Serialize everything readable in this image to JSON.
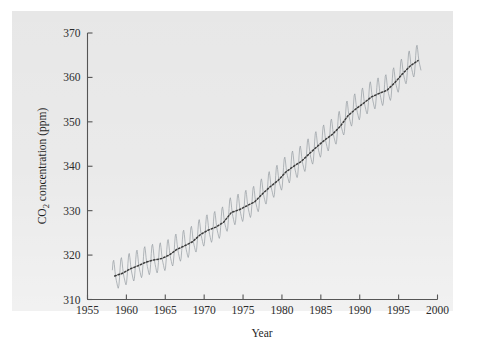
{
  "figure": {
    "background_color": "#ffffff",
    "panel_color": "#e6e6e6",
    "monthly_series_color": "#9aa0a6",
    "trend_series_color": "#3a3a3a"
  },
  "chart_data": {
    "type": "line",
    "title": "",
    "xlabel": "Year",
    "ylabel": "CO2 concentration (ppm)",
    "ylabel_parts": {
      "prefix": "CO",
      "subscript": "2",
      "suffix": " concentration (ppm)"
    },
    "xlim": [
      1955,
      2000
    ],
    "ylim": [
      310,
      370
    ],
    "xticks": [
      1955,
      1960,
      1965,
      1970,
      1975,
      1980,
      1985,
      1990,
      1995,
      2000
    ],
    "xtick_labels": [
      "1955",
      "1960",
      "1965",
      "1970",
      "1975",
      "1980",
      "1985",
      "1990",
      "1995",
      "2000"
    ],
    "yticks": [
      310,
      320,
      330,
      340,
      350,
      360,
      370
    ],
    "ytick_labels": [
      "310",
      "320",
      "330",
      "340",
      "350",
      "360",
      "370"
    ],
    "grid": false,
    "legend": null,
    "tick_direction": "in",
    "series": [
      {
        "name": "Monthly mean CO2",
        "color": "#9aa0a6",
        "style": "solid",
        "description": "Monthly Mauna Loa CO2 record with seasonal oscillation of about 6 ppm peak-to-trough",
        "x_start": 1958.2,
        "x_end": 1997.9,
        "seasonal_amplitude_ppm": 3.1,
        "seasonal_peak_month": 5,
        "seasonal_trough_month": 10
      },
      {
        "name": "Annual trend (smoothed)",
        "color": "#3a3a3a",
        "style": "dotted",
        "description": "Deseasonalized smooth trend through the monthly record",
        "x": [
          1958.5,
          1959.5,
          1960.5,
          1961.5,
          1962.5,
          1963.5,
          1964.5,
          1965.5,
          1966.5,
          1967.5,
          1968.5,
          1969.5,
          1970.5,
          1971.5,
          1972.5,
          1973.5,
          1974.5,
          1975.5,
          1976.5,
          1977.5,
          1978.5,
          1979.5,
          1980.5,
          1981.5,
          1982.5,
          1983.5,
          1984.5,
          1985.5,
          1986.5,
          1987.5,
          1988.5,
          1989.5,
          1990.5,
          1991.5,
          1992.5,
          1993.5,
          1994.5,
          1995.5,
          1996.5,
          1997.5
        ],
        "values": [
          315.3,
          315.9,
          316.9,
          317.6,
          318.4,
          318.9,
          319.2,
          320.0,
          321.3,
          322.1,
          323.0,
          324.6,
          325.6,
          326.3,
          327.4,
          329.6,
          330.2,
          331.1,
          332.0,
          333.8,
          335.4,
          336.8,
          338.7,
          340.0,
          341.1,
          342.8,
          344.4,
          345.9,
          347.2,
          349.0,
          351.4,
          352.9,
          354.2,
          355.6,
          356.4,
          357.1,
          358.8,
          360.8,
          362.6,
          363.8
        ]
      }
    ]
  },
  "annotations": {
    "page_mark": ""
  }
}
